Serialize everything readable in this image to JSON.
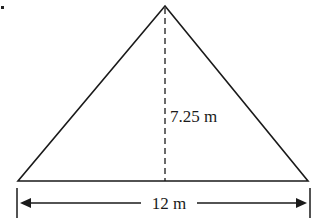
{
  "diagram": {
    "type": "triangle",
    "height_label": "7.25 m",
    "base_label": "12 m",
    "height_value": 7.25,
    "base_value": 12,
    "unit": "m",
    "stroke_color": "#1a1a1a",
    "background": "#ffffff"
  }
}
